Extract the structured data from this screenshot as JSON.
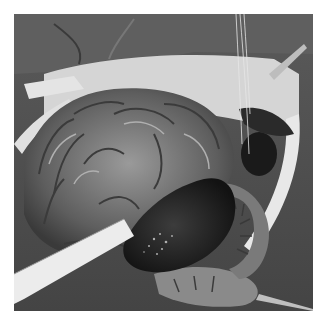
{
  "image": {
    "description": "Black-and-white surgical photograph of an open abdomen showing exposed coiled small intestine loops, a dark engorged bowel segment, retractors and a white drape",
    "style": "grayscale",
    "frame": {
      "x": 14,
      "y": 14,
      "width": 299,
      "height": 297
    },
    "background": "#ffffff",
    "tones": {
      "dark": "#1e1e1e",
      "mid": "#7a7a7a",
      "light": "#d8d8d8",
      "drape": "#4a4a4a"
    }
  }
}
